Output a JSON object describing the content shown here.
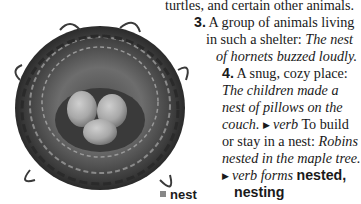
{
  "entry": {
    "line1": "turtles, and certain other animals.",
    "sense3": {
      "number": "3.",
      "definition_a": "A group of animals living",
      "definition_b": "in such a shelter: ",
      "example_a": "The nest",
      "example_b": "of hornets buzzed loudly."
    },
    "sense4": {
      "number": "4.",
      "definition": "A snug, cozy place:",
      "example_a": "The children made a",
      "example_b": "nest of pillows on the",
      "example_c": "couch."
    },
    "verb": {
      "marker": "▶",
      "pos": "verb",
      "definition_a": "To build",
      "definition_b": "or stay in a nest: ",
      "example_a": "Robins",
      "example_b": "nested in the maple tree."
    },
    "verb_forms": {
      "marker": "▶",
      "label": "verb forms",
      "form1": "nested,",
      "form2": "nesting"
    }
  },
  "image": {
    "subject": "bird-nest-with-three-eggs",
    "caption": "nest"
  }
}
